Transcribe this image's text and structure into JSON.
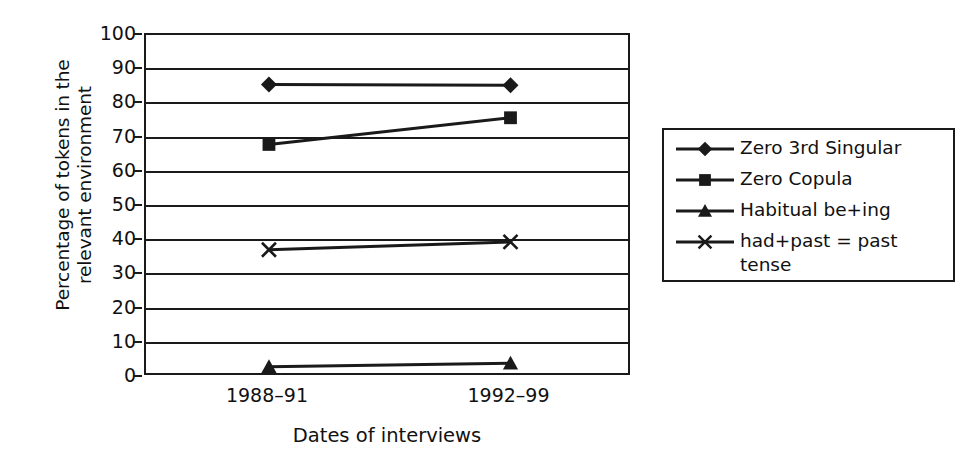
{
  "chart_data": {
    "type": "line",
    "title": "",
    "xlabel": "Dates of interviews",
    "ylabel": "Percentage of tokens in the\nrelevant environment",
    "categories": [
      "1988–91",
      "1992–99"
    ],
    "ylim": [
      0,
      100
    ],
    "ytick_step": 10,
    "yticks": [
      "100",
      "90",
      "80",
      "70",
      "60",
      "50",
      "40",
      "30",
      "20",
      "10",
      "0"
    ],
    "grid": true,
    "legend_position": "right",
    "series": [
      {
        "name": "Zero 3rd Singular",
        "marker": "diamond",
        "values": [
          85.5,
          85.3
        ]
      },
      {
        "name": "Zero Copula",
        "marker": "square",
        "values": [
          68.0,
          75.8
        ]
      },
      {
        "name": "Habitual be+ing",
        "marker": "triangle",
        "values": [
          3.0,
          4.0
        ]
      },
      {
        "name": "had+past = past\ntense",
        "marker": "cross",
        "values": [
          37.2,
          39.5
        ]
      }
    ],
    "colors": {
      "line": "#1a1a1a",
      "axis": "#1a1a1a",
      "grid": "#1a1a1a",
      "text": "#111111",
      "background": "#ffffff"
    }
  }
}
